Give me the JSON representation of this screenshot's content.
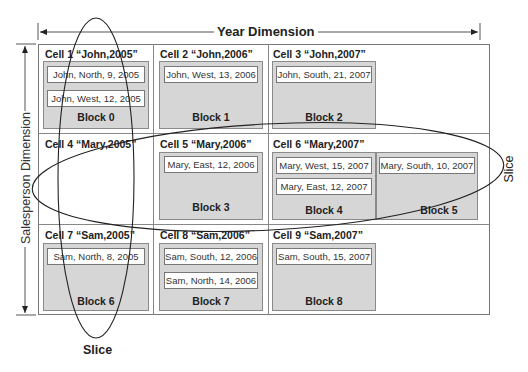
{
  "dimensions": {
    "year": "Year Dimension",
    "salesperson": "Salesperson Dimension"
  },
  "slices": {
    "vertical": "Slice",
    "horizontal": "Slice"
  },
  "cells": [
    {
      "title": "Cell 1 “John,2005”",
      "block": "Block 0",
      "records": [
        "John, North, 9, 2005",
        "John, West, 12, 2005"
      ]
    },
    {
      "title": "Cell 2 “John,2006”",
      "block": "Block 1",
      "records": [
        "John, West, 13, 2006"
      ]
    },
    {
      "title": "Cell 3 “John,2007”",
      "block": "Block 2",
      "records": [
        "John, South, 21, 2007"
      ]
    },
    {
      "title": "Cell 4 “Mary,2005”",
      "block": "",
      "records": []
    },
    {
      "title": "Cell 5 “Mary,2006”",
      "block": "Block 3",
      "records": [
        "Mary, East, 12, 2006"
      ]
    },
    {
      "title": "Cell 6 “Mary,2007”",
      "block": "Block 4",
      "records": [
        "Mary, West, 15, 2007",
        "Mary, East, 12, 2007"
      ],
      "block2": "Block 5",
      "records2": [
        "Mary, South, 10, 2007"
      ]
    },
    {
      "title": "Cell 7 “Sam,2005”",
      "block": "Block 6",
      "records": [
        "Sam, North, 8, 2005"
      ]
    },
    {
      "title": "Cell 8 “Sam,2006”",
      "block": "Block 7",
      "records": [
        "Sam, South, 12, 2006",
        "Sam, North, 14, 2006"
      ]
    },
    {
      "title": "Cell 9 “Sam,2007”",
      "block": "Block 8",
      "records": [
        "Sam, South, 15, 2007"
      ]
    }
  ]
}
